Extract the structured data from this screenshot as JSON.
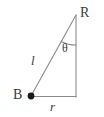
{
  "figure": {
    "kind": "right-triangle-geometry-diagram",
    "background_color": "#ffffff",
    "stroke_color": "#8a8a8a",
    "text_color": "#3b3b3b",
    "vertex_dot_color": "#1a1a1a"
  },
  "labels": {
    "apex": "R",
    "base_point": "B",
    "hypotenuse": "l",
    "base": "r",
    "angle": "θ"
  },
  "geometry": {
    "points": {
      "B": {
        "x": 31,
        "y": 96
      },
      "R": {
        "x": 76,
        "y": 15
      },
      "C": {
        "x": 76,
        "y": 97
      }
    },
    "segments": [
      {
        "name": "hypotenuse-BR",
        "from": "B",
        "to": "R",
        "label": "l"
      },
      {
        "name": "base-BC",
        "from": "B",
        "to": "C",
        "label": "r"
      },
      {
        "name": "vertical-RC",
        "from": "R",
        "to": "C",
        "label": ""
      }
    ],
    "angle_arc": {
      "at": "R",
      "label": "θ",
      "radius": 30
    },
    "marked_vertices": [
      "B"
    ]
  }
}
